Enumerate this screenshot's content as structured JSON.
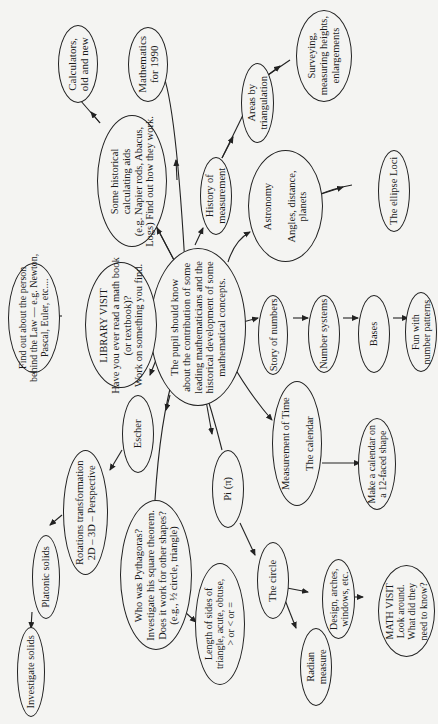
{
  "diagram": {
    "type": "concept-map",
    "center": {
      "id": "center",
      "label": "The pupil should know\nabout the contribution of some\nleading mathematicians and the\nhistorical development of some\nmathematical concepts."
    },
    "nodes": [
      {
        "id": "calculators",
        "label": "Calculators,\nold and new"
      },
      {
        "id": "maths1990",
        "label": "Mathematics\nfor 1990"
      },
      {
        "id": "calcaids",
        "label": "Some historical\ncalculating aids\n(e.g. Napier rods, Abacus,\nLogs) Find out how they work."
      },
      {
        "id": "histmeas",
        "label": "History of\nmeasurement"
      },
      {
        "id": "areas",
        "label": "Areas by\ntriangulation"
      },
      {
        "id": "surveying",
        "label": "Surveying,\nmeasuring heights,\nenlargements"
      },
      {
        "id": "astronomy",
        "label": "Astronomy\n\nAngles, distance,\nplanets"
      },
      {
        "id": "ellipse",
        "label": "The ellipse Loci"
      },
      {
        "id": "findout",
        "label": "Find out about the person\nbehind the Law — e.g. Newton,\nPascal, Euler, etc...."
      },
      {
        "id": "library",
        "label": "LIBRARY VISIT\nHave you ever read a math book\n(or textbook)?\nWork on something you find."
      },
      {
        "id": "story",
        "label": "Story of numbers"
      },
      {
        "id": "numsys",
        "label": "Number systems"
      },
      {
        "id": "bases",
        "label": "Bases"
      },
      {
        "id": "funpatterns",
        "label": "Fun with\nnumber patterns"
      },
      {
        "id": "escher",
        "label": "Escher"
      },
      {
        "id": "rotations",
        "label": "Rotations transformation\n2D – 3D – Perspective"
      },
      {
        "id": "platonic",
        "label": "Platonic solids"
      },
      {
        "id": "investigate",
        "label": "Investigate solids"
      },
      {
        "id": "pythagoras",
        "label": "Who was Pythagoras?\nInvestigate his square theorem.\nDoes it work for other shapes?\n(e.g., ½ circle, triangle)"
      },
      {
        "id": "pi",
        "label": "Pi (π)"
      },
      {
        "id": "timemeas",
        "label": "Measurement of Time\n\nThe calendar"
      },
      {
        "id": "makecal",
        "label": "Make a calendar on\na 12-faced shape"
      },
      {
        "id": "lengthsides",
        "label": "Length of sides of\ntriangle, acute, obtuse,\n> or < or ="
      },
      {
        "id": "circle",
        "label": "The circle"
      },
      {
        "id": "design",
        "label": "Design, arches,\nwindows, etc."
      },
      {
        "id": "radian",
        "label": "Radian\nmeasure"
      },
      {
        "id": "mathvisit",
        "label": "MATH VISIT\nLook around.\nWhat did they\nneed to know?"
      }
    ],
    "edges": [
      [
        "center",
        "calcaids"
      ],
      [
        "calcaids",
        "calculators"
      ],
      [
        "center",
        "maths1990"
      ],
      [
        "center",
        "histmeas"
      ],
      [
        "histmeas",
        "areas"
      ],
      [
        "areas",
        "surveying"
      ],
      [
        "center",
        "astronomy"
      ],
      [
        "astronomy",
        "ellipse"
      ],
      [
        "center",
        "library"
      ],
      [
        "library",
        "findout"
      ],
      [
        "center",
        "story"
      ],
      [
        "story",
        "numsys"
      ],
      [
        "numsys",
        "bases"
      ],
      [
        "bases",
        "funpatterns"
      ],
      [
        "center",
        "escher"
      ],
      [
        "escher",
        "rotations"
      ],
      [
        "rotations",
        "platonic"
      ],
      [
        "platonic",
        "investigate"
      ],
      [
        "center",
        "pythagoras"
      ],
      [
        "pythagoras",
        "lengthsides"
      ],
      [
        "center",
        "pi"
      ],
      [
        "pi",
        "circle"
      ],
      [
        "circle",
        "design"
      ],
      [
        "circle",
        "radian"
      ],
      [
        "design",
        "mathvisit"
      ],
      [
        "center",
        "timemeas"
      ],
      [
        "timemeas",
        "makecal"
      ]
    ]
  }
}
